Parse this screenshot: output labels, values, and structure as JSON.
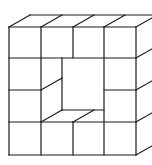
{
  "diagram": {
    "title": "",
    "stroke_color": "#1a1a1a",
    "background": "#ffffff",
    "grid": {
      "columns": 4,
      "rows": 4,
      "front_x": [
        9,
        41,
        73,
        104,
        136
      ],
      "front_y": [
        27,
        58,
        90,
        122,
        155
      ],
      "depth_dx": 21,
      "depth_dy": -12
    },
    "lines": [
      {
        "id": "front-left",
        "x1": 9,
        "y1": 27,
        "x2": 9,
        "y2": 155
      },
      {
        "id": "front-right",
        "x1": 136,
        "y1": 27,
        "x2": 136,
        "y2": 155
      },
      {
        "id": "front-top",
        "x1": 9,
        "y1": 27,
        "x2": 136,
        "y2": 27
      },
      {
        "id": "front-bottom",
        "x1": 9,
        "y1": 155,
        "x2": 136,
        "y2": 155
      },
      {
        "id": "col1-full",
        "x1": 41,
        "y1": 27,
        "x2": 41,
        "y2": 155
      },
      {
        "id": "col2-top",
        "x1": 73,
        "y1": 27,
        "x2": 73,
        "y2": 58
      },
      {
        "id": "col2-bottom",
        "x1": 73,
        "y1": 122,
        "x2": 73,
        "y2": 155
      },
      {
        "id": "col3-full",
        "x1": 104,
        "y1": 27,
        "x2": 104,
        "y2": 155
      },
      {
        "id": "row1",
        "x1": 9,
        "y1": 58,
        "x2": 136,
        "y2": 58
      },
      {
        "id": "row2-left",
        "x1": 9,
        "y1": 90,
        "x2": 41,
        "y2": 90
      },
      {
        "id": "row2-right",
        "x1": 104,
        "y1": 90,
        "x2": 136,
        "y2": 90
      },
      {
        "id": "row3",
        "x1": 9,
        "y1": 122,
        "x2": 136,
        "y2": 122
      },
      {
        "id": "top-back",
        "x1": 30,
        "y1": 15,
        "x2": 152,
        "y2": 15
      },
      {
        "id": "top-diag-0",
        "x1": 9,
        "y1": 27,
        "x2": 30,
        "y2": 15
      },
      {
        "id": "top-diag-1",
        "x1": 41,
        "y1": 27,
        "x2": 62,
        "y2": 15
      },
      {
        "id": "top-diag-2",
        "x1": 73,
        "y1": 27,
        "x2": 94,
        "y2": 15
      },
      {
        "id": "top-diag-3",
        "x1": 104,
        "y1": 27,
        "x2": 125,
        "y2": 15
      },
      {
        "id": "top-diag-4",
        "x1": 136,
        "y1": 27,
        "x2": 157,
        "y2": 15
      },
      {
        "id": "side-diag-1",
        "x1": 136,
        "y1": 58,
        "x2": 157,
        "y2": 46
      },
      {
        "id": "side-diag-2",
        "x1": 136,
        "y1": 90,
        "x2": 157,
        "y2": 78
      },
      {
        "id": "side-diag-3",
        "x1": 136,
        "y1": 122,
        "x2": 157,
        "y2": 110
      },
      {
        "id": "side-diag-4",
        "x1": 136,
        "y1": 155,
        "x2": 157,
        "y2": 143
      },
      {
        "id": "hole-back-left",
        "x1": 62,
        "y1": 58,
        "x2": 62,
        "y2": 110
      },
      {
        "id": "hole-back-bottom",
        "x1": 62,
        "y1": 110,
        "x2": 104,
        "y2": 110
      },
      {
        "id": "hole-diag-left",
        "x1": 41,
        "y1": 90,
        "x2": 62,
        "y2": 78
      },
      {
        "id": "hole-diag-corner",
        "x1": 41,
        "y1": 122,
        "x2": 62,
        "y2": 110
      },
      {
        "id": "hole-diag-floor",
        "x1": 73,
        "y1": 122,
        "x2": 94,
        "y2": 110
      }
    ]
  }
}
